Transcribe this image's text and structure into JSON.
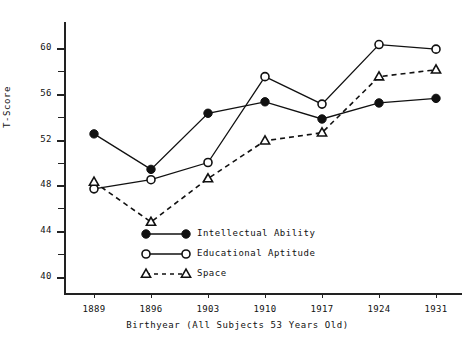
{
  "chart_data": {
    "type": "line",
    "title": "",
    "xlabel": "Birthyear (All Subjects 53 Years Old)",
    "ylabel": "T-Score",
    "categories": [
      "1889",
      "1896",
      "1903",
      "1910",
      "1917",
      "1924",
      "1931"
    ],
    "x": [
      1889,
      1896,
      1903,
      1910,
      1917,
      1924,
      1931
    ],
    "ylim": [
      38,
      62
    ],
    "ytick_labels": [
      "40",
      "44",
      "48",
      "52",
      "56",
      "60"
    ],
    "yticks": [
      40,
      44,
      48,
      52,
      56,
      60
    ],
    "yticks_minor": [
      42,
      46,
      50,
      54,
      58
    ],
    "grid": false,
    "legend_position": "lower-center",
    "series": [
      {
        "name": "Intellectual Ability",
        "marker": "filled-circle",
        "linestyle": "solid",
        "color": "#111111",
        "values": [
          52.5,
          49.4,
          54.3,
          55.3,
          53.8,
          55.2,
          55.6
        ]
      },
      {
        "name": "Educational Aptitude",
        "marker": "open-circle",
        "linestyle": "solid",
        "color": "#111111",
        "values": [
          47.7,
          48.5,
          50.0,
          57.5,
          55.1,
          60.3,
          59.9
        ]
      },
      {
        "name": "Space",
        "marker": "open-triangle",
        "linestyle": "dashed",
        "color": "#111111",
        "values": [
          48.3,
          44.8,
          48.6,
          51.9,
          52.6,
          57.5,
          58.1
        ]
      }
    ]
  }
}
